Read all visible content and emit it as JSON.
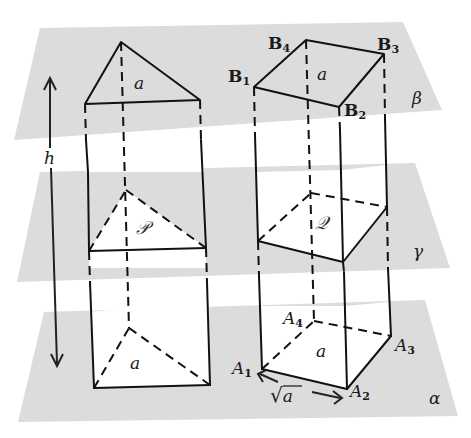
{
  "figure": {
    "colors": {
      "plane": "#dcdcdc",
      "background": "#ffffff",
      "line": "#111111"
    },
    "planes": [
      {
        "id": "beta",
        "label": "β"
      },
      {
        "id": "gamma",
        "label": "γ"
      },
      {
        "id": "alpha",
        "label": "α"
      }
    ],
    "height_label": "h",
    "triangular_prism": {
      "top_base_label": "a",
      "cross_section_label": "𝒫",
      "bottom_base_label": "a"
    },
    "square_prism": {
      "top_vertices": [
        {
          "letter": "B",
          "index": "1"
        },
        {
          "letter": "B",
          "index": "2"
        },
        {
          "letter": "B",
          "index": "3"
        },
        {
          "letter": "B",
          "index": "4"
        }
      ],
      "bottom_vertices": [
        {
          "letter": "A",
          "index": "1"
        },
        {
          "letter": "A",
          "index": "2"
        },
        {
          "letter": "A",
          "index": "3"
        },
        {
          "letter": "A",
          "index": "4"
        }
      ],
      "top_base_label": "a",
      "cross_section_label": "𝒬",
      "bottom_base_label": "a",
      "edge_length_label": {
        "radical": "√",
        "radicand": "a"
      }
    }
  }
}
